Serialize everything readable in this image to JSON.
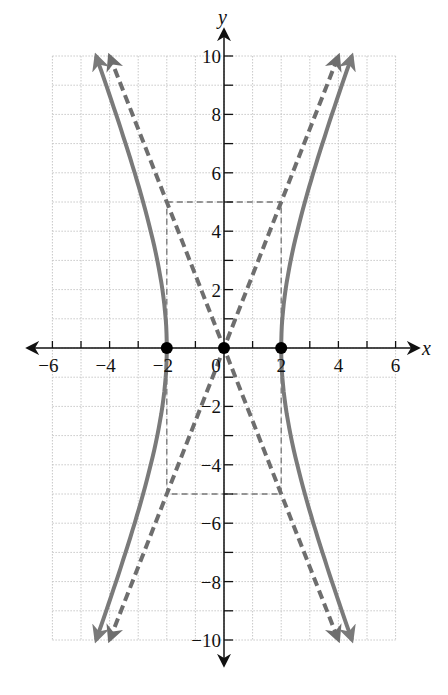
{
  "chart_data": {
    "type": "line",
    "title": "",
    "xlabel": "x",
    "ylabel": "y",
    "xlim": [
      -6,
      6
    ],
    "ylim": [
      -10,
      10
    ],
    "grid": true,
    "grid_step": 1,
    "x_ticks": [
      -6,
      -4,
      -2,
      0,
      2,
      4,
      6
    ],
    "x_tick_labels": [
      "−6",
      "−4",
      "−2",
      "0",
      "2",
      "4",
      "6"
    ],
    "y_ticks": [
      10,
      8,
      6,
      4,
      2,
      -2,
      -4,
      -6,
      -8,
      -10
    ],
    "y_tick_labels": [
      "10",
      "8",
      "6",
      "4",
      "2",
      "−2",
      "−4",
      "−6",
      "−8",
      "−10"
    ],
    "series": [
      {
        "name": "hyperbola",
        "equation": "x^2/4 - y^2/25 = 1",
        "style": "solid",
        "color": "#7a7a7a",
        "branches": [
          "right",
          "left"
        ],
        "y_range": [
          -10,
          10
        ]
      },
      {
        "name": "asymptote-positive",
        "equation": "y = 2.5x",
        "style": "dashed",
        "color": "#6e6e6e",
        "endpoints": [
          [
            -4,
            -10
          ],
          [
            4,
            10
          ]
        ]
      },
      {
        "name": "asymptote-negative",
        "equation": "y = -2.5x",
        "style": "dashed",
        "color": "#6e6e6e",
        "endpoints": [
          [
            -4,
            10
          ],
          [
            4,
            -10
          ]
        ]
      },
      {
        "name": "fundamental-rectangle",
        "style": "dashed-thin",
        "color": "#777777",
        "corners": [
          [
            -2,
            5
          ],
          [
            2,
            5
          ],
          [
            2,
            -5
          ],
          [
            -2,
            -5
          ]
        ]
      }
    ],
    "points": [
      {
        "label": "vertex-left",
        "x": -2,
        "y": 0
      },
      {
        "label": "center",
        "x": 0,
        "y": 0
      },
      {
        "label": "vertex-right",
        "x": 2,
        "y": 0
      }
    ]
  },
  "colors": {
    "axis": "#111111",
    "grid": "#c8c8c8",
    "curve": "#7a7a7a",
    "asymptote": "#6e6e6e",
    "point": "#000000"
  }
}
